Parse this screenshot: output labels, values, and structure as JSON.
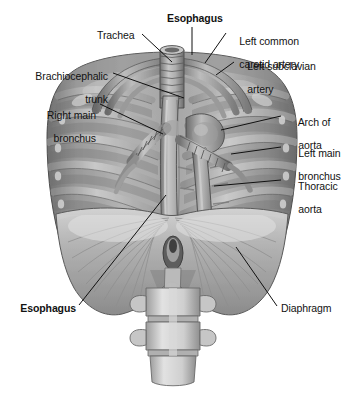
{
  "figure": {
    "background_color": "#ffffff",
    "ink_color": "#121212",
    "width": 345,
    "height": 396,
    "style": "grayscale anatomical illustration"
  },
  "labels": [
    {
      "id": "esophagus-top",
      "text": "Esophagus",
      "bold": true,
      "x": 167,
      "y": 13,
      "align": "left",
      "lines": [
        "Esophagus"
      ]
    },
    {
      "id": "trachea",
      "text": "Trachea",
      "bold": false,
      "x": 97,
      "y": 30,
      "align": "left",
      "lines": [
        "Trachea"
      ]
    },
    {
      "id": "left-common-carotid",
      "text": "Left common carotid artery",
      "bold": false,
      "x": 228,
      "y": 24,
      "align": "left",
      "lines": [
        "Left common",
        "carotid artery"
      ]
    },
    {
      "id": "left-subclavian",
      "text": "Left subclavian artery",
      "bold": false,
      "x": 236,
      "y": 49,
      "align": "left",
      "lines": [
        "Left subclavian",
        "artery"
      ]
    },
    {
      "id": "brachiocephalic-trunk",
      "text": "Brachiocephalic trunk",
      "bold": false,
      "x": 108,
      "y": 59,
      "align": "right",
      "lines": [
        "Brachiocephalic",
        "trunk"
      ]
    },
    {
      "id": "right-main-bronchus",
      "text": "Right main bronchus",
      "bold": false,
      "x": 96,
      "y": 98,
      "align": "right",
      "lines": [
        "Right main",
        "bronchus"
      ]
    },
    {
      "id": "arch-of-aorta",
      "text": "Arch of aorta",
      "bold": false,
      "x": 283,
      "y": 105,
      "align": "left",
      "lines": [
        "Arch of",
        "aorta"
      ]
    },
    {
      "id": "left-main-bronchus",
      "text": "Left main bronchus",
      "bold": false,
      "x": 283,
      "y": 136,
      "align": "left",
      "lines": [
        "Left main",
        "bronchus"
      ]
    },
    {
      "id": "thoracic-aorta",
      "text": "Thoracic aorta",
      "bold": false,
      "x": 283,
      "y": 169,
      "align": "left",
      "lines": [
        "Thoracic",
        "aorta"
      ]
    },
    {
      "id": "esophagus-bottom",
      "text": "Esophagus",
      "bold": true,
      "x": 76,
      "y": 303,
      "align": "right",
      "lines": [
        "Esophagus"
      ]
    },
    {
      "id": "diaphragm",
      "text": "Diaphragm",
      "bold": false,
      "x": 279,
      "y": 303,
      "align": "left",
      "lines": [
        "Diaphragm"
      ]
    }
  ],
  "leader_lines": [
    {
      "id": "leader-esophagus-top",
      "from": [
        192,
        27
      ],
      "to": [
        192,
        55
      ]
    },
    {
      "id": "leader-trachea",
      "from": [
        142,
        34
      ],
      "to": [
        172,
        62
      ]
    },
    {
      "id": "leader-left-common-carotid",
      "from": [
        226,
        33
      ],
      "to": [
        205,
        63
      ]
    },
    {
      "id": "leader-left-subclavian",
      "from": [
        234,
        62
      ],
      "to": [
        216,
        75
      ]
    },
    {
      "id": "leader-brachiocephalic",
      "from": [
        113,
        73
      ],
      "to": [
        184,
        98
      ]
    },
    {
      "id": "leader-right-main-bronchus",
      "from": [
        100,
        104
      ],
      "to": [
        163,
        134
      ]
    },
    {
      "id": "leader-arch-of-aorta",
      "from": [
        281,
        116
      ],
      "to": [
        221,
        130
      ]
    },
    {
      "id": "leader-left-main-bronchus",
      "from": [
        281,
        147
      ],
      "to": [
        231,
        154
      ]
    },
    {
      "id": "leader-thoracic-aorta",
      "from": [
        281,
        180
      ],
      "to": [
        214,
        186
      ]
    },
    {
      "id": "leader-esophagus-bottom",
      "from": [
        79,
        305
      ],
      "to": [
        166,
        195
      ]
    },
    {
      "id": "leader-diaphragm",
      "from": [
        277,
        306
      ],
      "to": [
        236,
        247
      ]
    }
  ],
  "structures": [
    {
      "id": "trachea",
      "name": "Trachea"
    },
    {
      "id": "esophagus",
      "name": "Esophagus"
    },
    {
      "id": "aortic-arch",
      "name": "Arch of aorta"
    },
    {
      "id": "thoracic-aorta",
      "name": "Thoracic aorta"
    },
    {
      "id": "right-main-bronchus",
      "name": "Right main bronchus"
    },
    {
      "id": "left-main-bronchus",
      "name": "Left main bronchus"
    },
    {
      "id": "brachiocephalic-trunk",
      "name": "Brachiocephalic trunk"
    },
    {
      "id": "left-common-carotid-artery",
      "name": "Left common carotid artery"
    },
    {
      "id": "left-subclavian-artery",
      "name": "Left subclavian artery"
    },
    {
      "id": "rib-cage",
      "name": "Rib cage"
    },
    {
      "id": "diaphragm",
      "name": "Diaphragm"
    },
    {
      "id": "lumbar-vertebrae",
      "name": "Lumbar vertebrae"
    }
  ]
}
